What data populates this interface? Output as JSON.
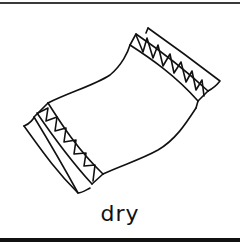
{
  "illustration": {
    "subject": "towel",
    "label": "dry",
    "stroke_color": "#111111",
    "background_color": "#ffffff"
  }
}
